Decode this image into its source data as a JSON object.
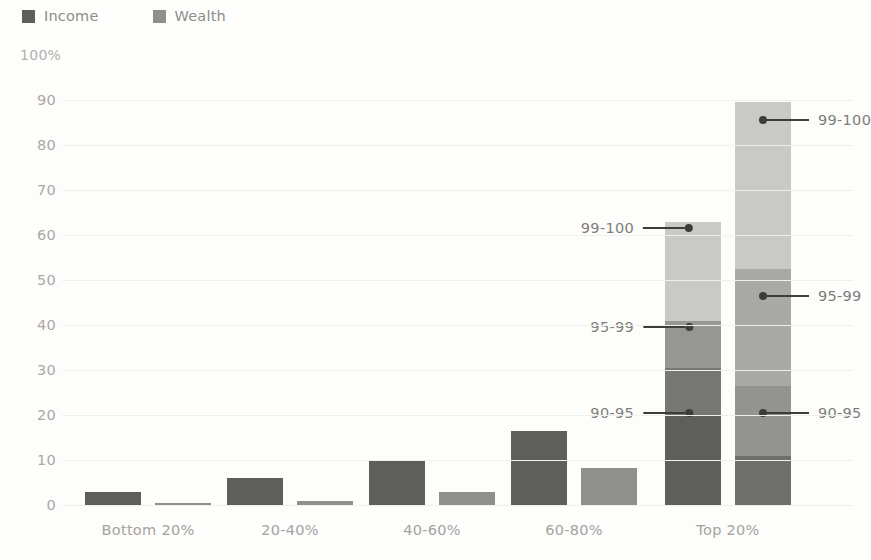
{
  "chart_data": {
    "type": "bar",
    "subtype": "grouped-stacked-bar",
    "title": "",
    "xlabel": "",
    "ylabel": "",
    "ylim": [
      0,
      100
    ],
    "y_top_label": "100%",
    "yticks": [
      90,
      80,
      70,
      60,
      50,
      40,
      30,
      20,
      10,
      0
    ],
    "grid": true,
    "legend_position": "top-left",
    "categories": [
      "Bottom 20%",
      "20-40%",
      "40-60%",
      "60-80%",
      "Top 20%"
    ],
    "series": [
      {
        "name": "Income",
        "color": "#5e5e5c",
        "values": [
          3,
          6,
          10,
          16.5,
          63
        ]
      },
      {
        "name": "Wealth",
        "color": "#8f8f8c",
        "values": [
          0.3,
          0.8,
          2.8,
          8.3,
          89.5
        ]
      }
    ],
    "stacked_top_group": {
      "category": "Top 20%",
      "segment_labels": [
        "80-90",
        "90-95",
        "95-99",
        "99-100"
      ],
      "income": {
        "segments": [
          20,
          10.5,
          10.5,
          22
        ],
        "cumulative": [
          20,
          30.5,
          41,
          63
        ],
        "colors": [
          "#5e5e5c",
          "#777775",
          "#969694",
          "#c9c9c7"
        ]
      },
      "wealth": {
        "segments": [
          11,
          15.5,
          26,
          37
        ],
        "cumulative": [
          11,
          26.5,
          52.5,
          89.5
        ],
        "colors": [
          "#6e6e6c",
          "#939391",
          "#a9a9a7",
          "#c9c9c7"
        ]
      }
    },
    "annotations": [
      {
        "text": "99-100",
        "side": "left",
        "series": "Income",
        "value": 61.5
      },
      {
        "text": "95-99",
        "side": "left",
        "series": "Income",
        "value": 39.5
      },
      {
        "text": "90-95",
        "side": "left",
        "series": "Income",
        "value": 20.5
      },
      {
        "text": "99-100",
        "side": "right",
        "series": "Wealth",
        "value": 85.5
      },
      {
        "text": "95-99",
        "side": "right",
        "series": "Wealth",
        "value": 46.5
      },
      {
        "text": "90-95",
        "side": "right",
        "series": "Wealth",
        "value": 20.5
      }
    ]
  }
}
